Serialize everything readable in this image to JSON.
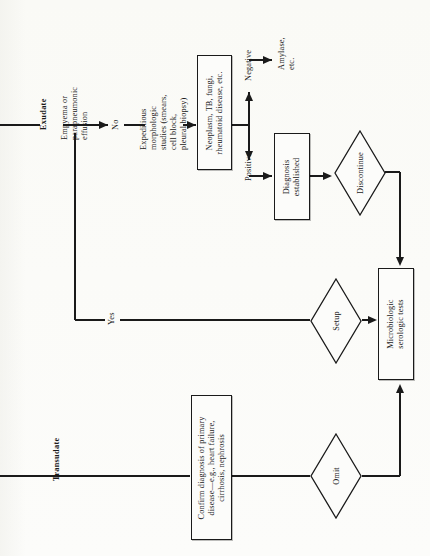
{
  "figure": {
    "type": "flowchart",
    "orientation": "rotated-90-ccw",
    "width": 430,
    "height": 556,
    "background_color": "#fbfbf9",
    "line_color": "#1a1a1a"
  },
  "branch_labels": {
    "exudate": "Exudate",
    "transudate": "Transudate"
  },
  "nodes": {
    "empyema": "Empyema or\nparapneumonic\neffusion",
    "no": "No",
    "yes": "Yes",
    "expeditious": "Expeditious\nmorphologic\nstudies (smears,\ncell block,\npleural biopsy)",
    "neoplasm": "Neoplasm, TB, fungi,\nrheumatoid disease, etc.",
    "negative": "Negative",
    "positive": "Positive",
    "amylase": "Amylase,\netc.",
    "diagnosis_established": "Diagnosis\nestablished",
    "discontinue": "Discontinue",
    "setup": "Setup",
    "omit": "Omit",
    "microbiologic": "Microbiologic\nserologic tests",
    "confirm": "Confirm diagnosis of primary\ndisease—e.g., heart failure,\ncirrhosis, nephrosis"
  }
}
